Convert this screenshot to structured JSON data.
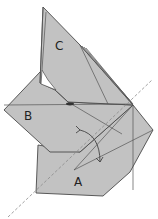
{
  "diagram": {
    "type": "origami-fold-step",
    "colors": {
      "paper": "#c2c2c2",
      "paper_dark": "#b4b4b4",
      "edge": "#4a4a4a",
      "crease": "#555555",
      "dashed_axis": "#9a9a9a",
      "white_gap": "#ffffff"
    },
    "labels": {
      "a": "A",
      "b": "B",
      "c": "C"
    },
    "arrow": {
      "kind": "curved-double-arrow",
      "meaning": "rotate / swing fold"
    },
    "axis": {
      "style": "dashed",
      "meaning": "fold axis"
    }
  }
}
